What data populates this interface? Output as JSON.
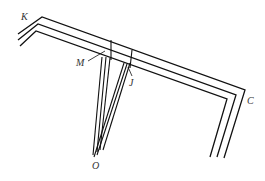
{
  "diagram": {
    "type": "geometry-ray-diagram",
    "labels": {
      "K": "K",
      "M": "M",
      "J": "J",
      "C": "C",
      "O": "O"
    },
    "colors": {
      "line": "#111111",
      "label": "#333333",
      "background": "#ffffff"
    }
  }
}
